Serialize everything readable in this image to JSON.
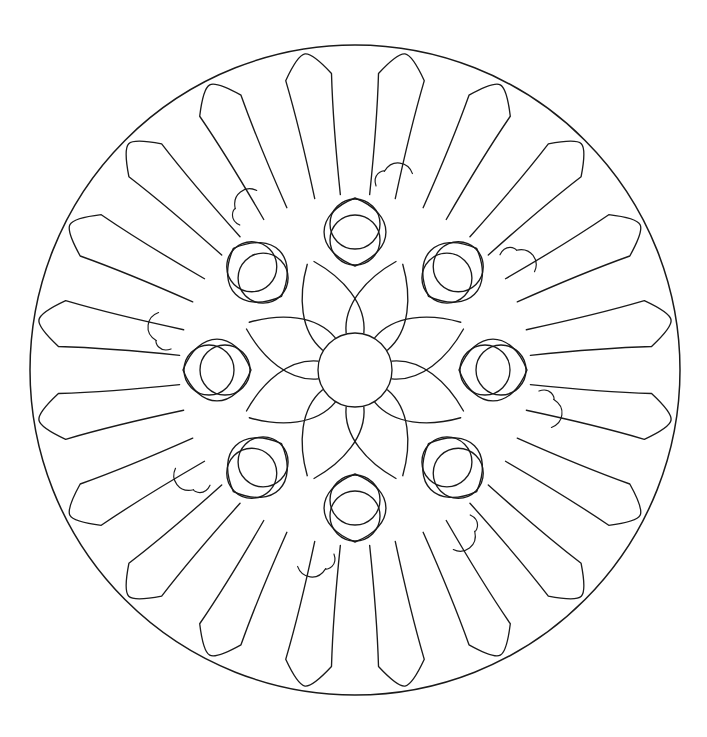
{
  "document": {
    "kind": "coloring-page",
    "subject": "mandala",
    "background_color": "#ffffff",
    "line_color": "#1a1a1a",
    "canvas": {
      "width": 707,
      "height": 737
    }
  },
  "geometry": {
    "center": {
      "x": 355,
      "y": 370
    },
    "outer_circle_radius": 325,
    "center_circle_radius": 37
  },
  "rings": [
    {
      "name": "outer-rim",
      "type": "circle",
      "radius": 325,
      "count": 1,
      "description": "Single thin outer boundary circle enclosing the whole mandala"
    },
    {
      "name": "outer-petal-ring",
      "type": "finger-petal",
      "count": 20,
      "inner_radius": 176,
      "outer_radius": 320,
      "half_width_inner": 13,
      "half_width_outer": 25,
      "description": "Twenty long rounded finger-shaped petals radiating to the rim"
    },
    {
      "name": "flourish-ring",
      "type": "hook-curve",
      "count": 8,
      "radius": 205,
      "description": "Eight small comma or hook shaped decorative flourishes tucked between the outer petals"
    },
    {
      "name": "vesica-ring",
      "type": "vesica-lens",
      "count": 8,
      "inner_radius": 104,
      "outer_radius": 172,
      "lens_half_width": 33,
      "end_circle_radius": 25,
      "description": "Eight almond lens shapes in a ring, each holding a circle at both of its ends"
    },
    {
      "name": "vesica-circle-ring",
      "type": "circle",
      "count": 16,
      "radius": 25,
      "description": "Sixteen small circles, two capping each vesica lens"
    },
    {
      "name": "inner-petal-ring",
      "type": "curved-petal",
      "count": 8,
      "inner_radius": 37,
      "outer_radius": 108,
      "description": "Eight swirled petals fanning out from the hub circle to the vesica ring"
    },
    {
      "name": "center-hub",
      "type": "circle",
      "radius": 37,
      "count": 1,
      "description": "Plain circle at the very middle of the mandala"
    }
  ],
  "symmetry": {
    "outer_fold": 20,
    "inner_fold": 8,
    "rotational": true,
    "mirror": true
  },
  "palette": {
    "stroke": "#1a1a1a",
    "fill": "#ffffff"
  }
}
